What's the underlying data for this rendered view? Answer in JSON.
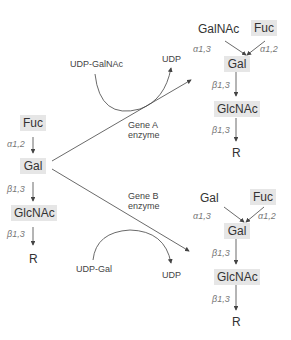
{
  "diagram": {
    "left_chain": {
      "fuc": "Fuc",
      "bond1": "α1,2",
      "gal": "Gal",
      "bond2": "β1,3",
      "glcnac": "GlcNAc",
      "bond3": "β1,3",
      "r": "R"
    },
    "reaction_a": {
      "donor": "UDP-GalNAc",
      "product": "UDP",
      "enzyme_line1": "Gene A",
      "enzyme_line2": "enzyme"
    },
    "reaction_b": {
      "donor": "UDP-Gal",
      "product": "UDP",
      "enzyme_line1": "Gene B",
      "enzyme_line2": "enzyme"
    },
    "product_a": {
      "left_sugar": "GalNAc",
      "right_sugar": "Fuc",
      "bond_left": "α1,3",
      "bond_right": "α1,2",
      "gal": "Gal",
      "bond2": "β1,3",
      "glcnac": "GlcNAc",
      "bond3": "β1,3",
      "r": "R"
    },
    "product_b": {
      "left_sugar": "Gal",
      "right_sugar": "Fuc",
      "bond_left": "α1,3",
      "bond_right": "α1,2",
      "gal": "Gal",
      "bond2": "β1,3",
      "glcnac": "GlcNAc",
      "bond3": "β1,3",
      "r": "R"
    },
    "colors": {
      "box_fill": "#e6e6e6",
      "line": "#444444",
      "bond_text": "#777777"
    }
  }
}
